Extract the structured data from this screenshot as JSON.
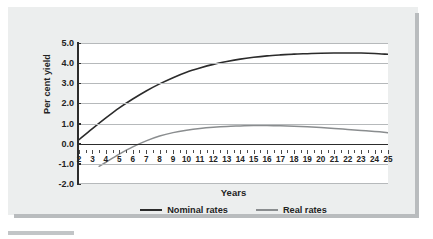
{
  "figure": {
    "background_color": "#eceeee",
    "plot_background_color": "#ffffff",
    "shadow_color": "#b9bcbe"
  },
  "axis": {
    "x_title": "Years",
    "y_title": "Per cent yield",
    "y_tick_labels": [
      "5.0",
      "4.0",
      "3.0",
      "2.0",
      "1.0",
      "0.0",
      "-1.0",
      "-2.0"
    ],
    "x_tick_labels": [
      "2",
      "3",
      "4",
      "5",
      "6",
      "7",
      "8",
      "9",
      "10",
      "11",
      "12",
      "13",
      "14",
      "15",
      "16",
      "17",
      "18",
      "19",
      "20",
      "21",
      "22",
      "23",
      "24",
      "25"
    ]
  },
  "legend": {
    "items": [
      {
        "label": "Nominal rates",
        "color": "#2b2b2b"
      },
      {
        "label": "Real rates",
        "color": "#8a8d8f"
      }
    ]
  },
  "chart_data": {
    "type": "line",
    "title": "",
    "subtitle": "",
    "xlabel": "Years",
    "ylabel": "Per cent yield",
    "xlim": [
      2,
      25
    ],
    "ylim": [
      -2.0,
      5.0
    ],
    "yticks": [
      -2.0,
      -1.0,
      0.0,
      1.0,
      2.0,
      3.0,
      4.0,
      5.0
    ],
    "grid": true,
    "grid_axis": "y",
    "legend_position": "bottom-center",
    "x": [
      2,
      3,
      4,
      5,
      6,
      7,
      8,
      9,
      10,
      11,
      12,
      13,
      14,
      15,
      16,
      17,
      18,
      19,
      20,
      21,
      22,
      23,
      24,
      25
    ],
    "series": [
      {
        "name": "Nominal rates",
        "color": "#2b2b2b",
        "x": [
          2,
          3,
          4,
          5,
          6,
          7,
          8,
          9,
          10,
          11,
          12,
          13,
          14,
          15,
          16,
          17,
          18,
          19,
          20,
          21,
          22,
          23,
          24,
          25
        ],
        "values": [
          0.2,
          0.75,
          1.28,
          1.78,
          2.22,
          2.62,
          2.97,
          3.28,
          3.55,
          3.76,
          3.94,
          4.08,
          4.2,
          4.29,
          4.36,
          4.41,
          4.45,
          4.47,
          4.49,
          4.5,
          4.5,
          4.5,
          4.48,
          4.44
        ]
      },
      {
        "name": "Real rates",
        "color": "#8a8d8f",
        "x": [
          3.5,
          4,
          5,
          6,
          7,
          8,
          9,
          10,
          11,
          12,
          13,
          14,
          15,
          16,
          17,
          18,
          19,
          20,
          21,
          22,
          23,
          24,
          25
        ],
        "values": [
          -1.12,
          -0.92,
          -0.52,
          -0.16,
          0.14,
          0.38,
          0.55,
          0.67,
          0.76,
          0.82,
          0.86,
          0.88,
          0.9,
          0.9,
          0.89,
          0.87,
          0.84,
          0.8,
          0.76,
          0.71,
          0.66,
          0.61,
          0.55
        ]
      }
    ],
    "annotations": []
  }
}
